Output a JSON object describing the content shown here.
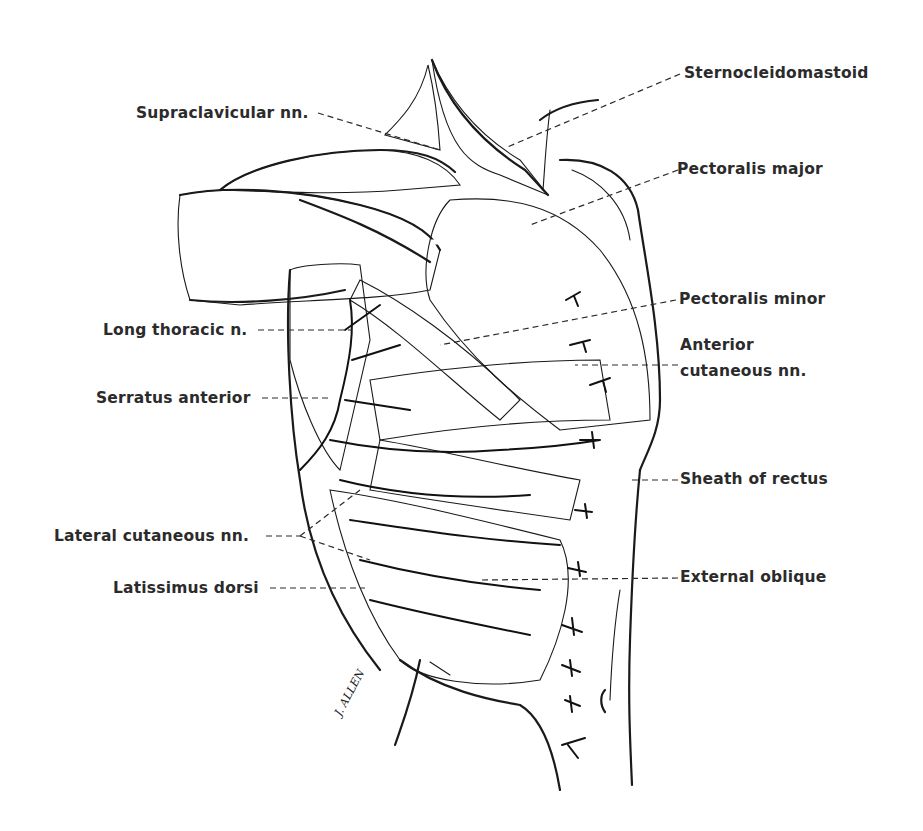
{
  "figure": {
    "type": "anatomical-illustration",
    "style": "black-and-white pen hatching",
    "signature": "J. ALLEN",
    "colors": {
      "ink": "#1a1a1a",
      "label_text": "#2b2b2b",
      "background": "#ffffff"
    }
  },
  "labels": {
    "left": [
      {
        "id": "supraclavicular",
        "text": "Supraclavicular nn."
      },
      {
        "id": "long_thoracic",
        "text": "Long thoracic n."
      },
      {
        "id": "serratus_anterior",
        "text": "Serratus anterior"
      },
      {
        "id": "lateral_cutaneous",
        "text": "Lateral cutaneous nn."
      },
      {
        "id": "latissimus_dorsi",
        "text": "Latissimus dorsi"
      }
    ],
    "right": [
      {
        "id": "sternocleidomastoid",
        "text": "Sternocleidomastoid"
      },
      {
        "id": "pectoralis_major",
        "text": "Pectoralis major"
      },
      {
        "id": "pectoralis_minor",
        "text": "Pectoralis minor"
      },
      {
        "id": "anterior_cutaneous",
        "text": "Anterior",
        "text2": "cutaneous nn."
      },
      {
        "id": "sheath_of_rectus",
        "text": "Sheath of rectus"
      },
      {
        "id": "external_oblique",
        "text": "External oblique"
      }
    ]
  }
}
